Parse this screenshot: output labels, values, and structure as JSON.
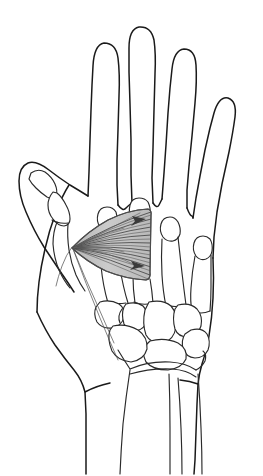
{
  "figure": {
    "view": "palmar view",
    "background_color": "#ffffff",
    "outline_color": "#1a1a1a",
    "bone_outline_color": "#2a2a2a",
    "muscle_fill_color": "#c8c8c8",
    "muscle_fiber_color": "#5e5e5e",
    "arrow_color": "#3a3a3a"
  },
  "hand_outline": {
    "name": "hand-silhouette",
    "description": "continuous contour of hand, four fingers, thumb and forearm",
    "stroke_width": 1.5
  },
  "digits": [
    {
      "name": "thumb",
      "label": "thumb",
      "position": "leftmost"
    },
    {
      "name": "index-finger",
      "label": "index finger",
      "position": "second from left"
    },
    {
      "name": "middle-finger",
      "label": "middle finger",
      "position": "center, longest"
    },
    {
      "name": "ring-finger",
      "label": "ring finger",
      "position": "fourth"
    },
    {
      "name": "little-finger",
      "label": "little finger",
      "position": "rightmost, shortest"
    }
  ],
  "bone_groups": [
    {
      "name": "thumb-phalanges",
      "label": "thumb phalanges",
      "count": 2
    },
    {
      "name": "metacarpals",
      "label": "metacarpal bones",
      "count": 4
    },
    {
      "name": "carpals",
      "label": "carpal bones",
      "count": 8
    },
    {
      "name": "radius",
      "label": "radius",
      "count": 1
    },
    {
      "name": "ulna",
      "label": "ulna",
      "count": 1
    }
  ],
  "muscle": {
    "name": "adductor-pollicis",
    "label": "adductor pollicis",
    "shape": "triangular fan",
    "fill": "#c8c8c8",
    "fiber_count": 22,
    "apex": {
      "x": 72,
      "y": 248
    },
    "base_top": {
      "x": 151,
      "y": 211
    },
    "base_bottom": {
      "x": 149,
      "y": 279
    },
    "arrows": [
      {
        "name": "upper-force-arrow",
        "x": 143,
        "y": 221,
        "angle": -14
      },
      {
        "name": "lower-force-arrow",
        "x": 141,
        "y": 264,
        "angle": 14
      }
    ]
  },
  "tendon_lines": [
    {
      "name": "tendon-line-proximal",
      "description": "thin line from muscle apex toward thumb base"
    },
    {
      "name": "tendon-line-distal",
      "description": "thin line from muscle apex toward carpus"
    }
  ]
}
